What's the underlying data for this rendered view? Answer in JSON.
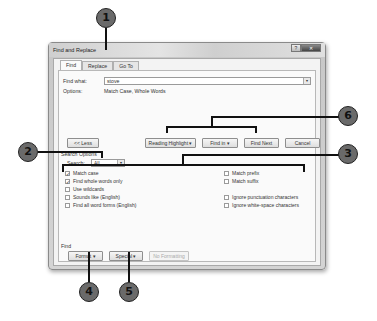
{
  "dialog": {
    "title": "Find and Replace",
    "title_buttons": {
      "help": "?",
      "close": "Close"
    },
    "tabs": [
      {
        "label": "Find",
        "active": true
      },
      {
        "label": "Replace",
        "active": false
      },
      {
        "label": "Go To",
        "active": false
      }
    ],
    "find_what_label": "Find what:",
    "find_what_value": "stove",
    "options_label": "Options:",
    "options_value": "Match Case, Whole Words",
    "buttons": {
      "less": "<< Less",
      "reading_highlight": "Reading Highlight ▾",
      "find_in": "Find in ▾",
      "find_next": "Find Next",
      "cancel": "Cancel"
    },
    "search_options_heading": "Search Options",
    "search_label": "Search:",
    "search_value": "All",
    "checkboxes_left": [
      {
        "label": "Match case",
        "checked": true
      },
      {
        "label": "Find whole words only",
        "checked": true
      },
      {
        "label": "Use wildcards",
        "checked": false
      },
      {
        "label": "Sounds like (English)",
        "checked": false
      },
      {
        "label": "Find all word forms (English)",
        "checked": false
      }
    ],
    "checkboxes_right": [
      {
        "label": "Match prefix",
        "checked": false
      },
      {
        "label": "Match suffix",
        "checked": false
      },
      {
        "label": "Ignore punctuation characters",
        "checked": false
      },
      {
        "label": "Ignore white-space characters",
        "checked": false
      }
    ],
    "find_heading": "Find",
    "format_button": "Format ▾",
    "special_button": "Special ▾",
    "no_formatting_button": "No Formatting"
  },
  "callouts": [
    "1",
    "2",
    "3",
    "4",
    "5",
    "6"
  ],
  "check_mark": "✓"
}
